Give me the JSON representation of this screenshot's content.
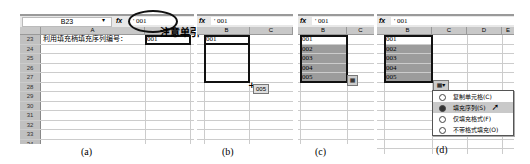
{
  "formula_bar": {
    "name_box": "B23",
    "fx_label": "fx",
    "formula_value": "' 001"
  },
  "columns": [
    "A",
    "B",
    "C",
    "D",
    "E"
  ],
  "row_numbers": [
    "23",
    "24",
    "25",
    "26",
    "27",
    "28",
    "29",
    "30",
    "31",
    "32",
    "33",
    "34",
    "35"
  ],
  "panels": {
    "a": {
      "caption": "(a)",
      "cell_a23": "利用填充柄填充序列编号：",
      "cell_b23": "001",
      "annotation": "注意单引号"
    },
    "b": {
      "caption": "(b)",
      "cell_b23": "001",
      "drag_tooltip": "005"
    },
    "c": {
      "caption": "(c)",
      "values": [
        "001",
        "002",
        "003",
        "004",
        "005"
      ]
    },
    "d": {
      "caption": "(d)",
      "values": [
        "001",
        "002",
        "003",
        "004",
        "005"
      ],
      "autofill_menu": [
        {
          "label": "复制单元格(C)",
          "selected": false
        },
        {
          "label": "填充序列(S)",
          "selected": true
        },
        {
          "label": "仅填充格式(F)",
          "selected": false
        },
        {
          "label": "不带格式填充(O)",
          "selected": false
        }
      ]
    }
  },
  "colors": {
    "selection_fill": "#9c9c9c",
    "header_bg": "#c8c8c8",
    "gridline": "#cccccc"
  }
}
